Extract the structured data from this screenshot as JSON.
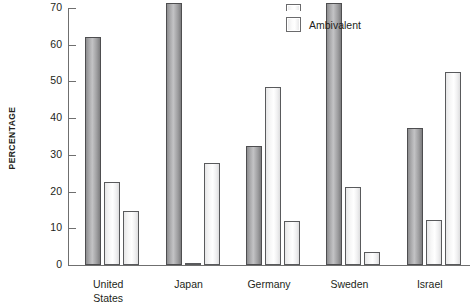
{
  "chart_data": {
    "type": "bar",
    "title": "",
    "xlabel": "",
    "ylabel": "PERCENTAGE",
    "ylim": [
      0,
      70
    ],
    "yticks": [
      0,
      10,
      20,
      30,
      40,
      50,
      60,
      70
    ],
    "ytick_labels": [
      "0",
      "10",
      "20",
      "30",
      "40",
      "50",
      "60",
      "70"
    ],
    "grid": false,
    "legend_position": "top-center",
    "categories": [
      "United States",
      "Japan",
      "Germany",
      "Sweden",
      "Israel"
    ],
    "category_lines": [
      [
        "United",
        "States"
      ],
      [
        "Japan"
      ],
      [
        "Germany"
      ],
      [
        "Sweden"
      ],
      [
        "Israel"
      ]
    ],
    "series": [
      {
        "name": "series-1",
        "style": "dark",
        "color": "#a0a0a2",
        "values": [
          62.0,
          71.5,
          32.5,
          71.5,
          37.3
        ]
      },
      {
        "name": "series-2",
        "style": "light",
        "color": "#fbfbfb",
        "values": [
          22.7,
          0.5,
          48.6,
          21.3,
          12.3
        ]
      },
      {
        "name": "Ambivalent",
        "style": "light",
        "color": "#fbfbfb",
        "values": [
          14.8,
          27.8,
          12.0,
          3.6,
          52.6
        ]
      }
    ]
  },
  "legend": {
    "items": [
      {
        "label": "",
        "swatch": "light",
        "clipped": true
      },
      {
        "label": "Ambivalent",
        "swatch": "light",
        "clipped": false
      }
    ]
  },
  "axis": {
    "y_title": "PERCENTAGE"
  }
}
